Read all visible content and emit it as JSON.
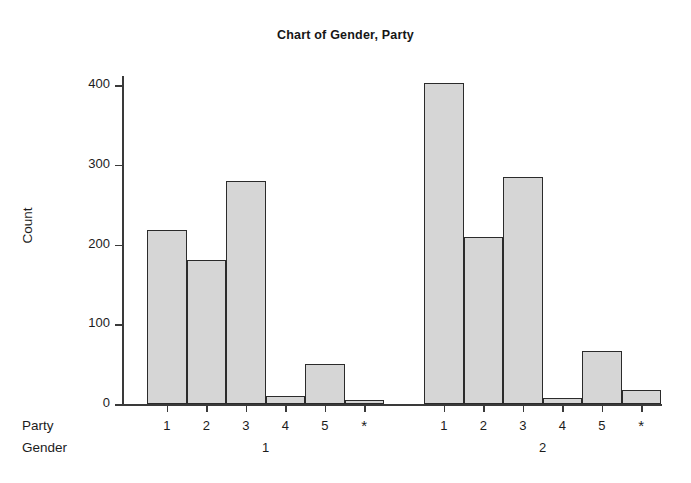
{
  "chart_data": {
    "type": "bar",
    "title": "Chart of Gender, Party",
    "xlabel": "",
    "ylabel": "Count",
    "ylim": [
      0,
      430
    ],
    "yticks": [
      0,
      100,
      200,
      300,
      400
    ],
    "ytick_labels": [
      "0",
      "100",
      "200",
      "300",
      "400"
    ],
    "grid": false,
    "legend": "none",
    "group_axis_name": "Gender",
    "category_axis_name": "Party",
    "categories": [
      "1",
      "2",
      "3",
      "4",
      "5",
      "*"
    ],
    "groups": [
      {
        "group_label": "1",
        "values": [
          218,
          181,
          279,
          10,
          50,
          5
        ]
      },
      {
        "group_label": "2",
        "values": [
          403,
          210,
          285,
          7,
          66,
          18
        ]
      }
    ],
    "bar_fill_color": "#d6d6d6",
    "bar_edge_color": "#2b2b2b",
    "axis_color": "#3a3a3a",
    "background_color": "#ffffff"
  }
}
